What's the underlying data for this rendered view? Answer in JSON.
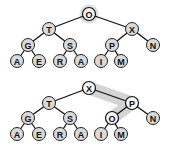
{
  "diagram": {
    "type": "heap-sink-illustration",
    "trees": [
      {
        "name": "before",
        "highlight_root": true,
        "nodes": [
          {
            "id": "n1",
            "label": "O",
            "x": 89,
            "y": 14
          },
          {
            "id": "n2",
            "label": "T",
            "x": 49,
            "y": 29
          },
          {
            "id": "n3",
            "label": "X",
            "x": 132,
            "y": 29
          },
          {
            "id": "n4",
            "label": "G",
            "x": 28,
            "y": 45
          },
          {
            "id": "n5",
            "label": "S",
            "x": 70,
            "y": 45
          },
          {
            "id": "n6",
            "label": "P",
            "x": 112,
            "y": 45
          },
          {
            "id": "n7",
            "label": "N",
            "x": 153,
            "y": 45
          },
          {
            "id": "n8",
            "label": "A",
            "x": 17,
            "y": 61
          },
          {
            "id": "n9",
            "label": "E",
            "x": 39,
            "y": 61
          },
          {
            "id": "n10",
            "label": "R",
            "x": 60,
            "y": 61
          },
          {
            "id": "n11",
            "label": "A",
            "x": 81,
            "y": 61
          },
          {
            "id": "n12",
            "label": "I",
            "x": 101,
            "y": 61
          },
          {
            "id": "n13",
            "label": "M",
            "x": 121,
            "y": 61
          }
        ],
        "edges": [
          [
            "n1",
            "n2"
          ],
          [
            "n1",
            "n3"
          ],
          [
            "n2",
            "n4"
          ],
          [
            "n2",
            "n5"
          ],
          [
            "n3",
            "n6"
          ],
          [
            "n3",
            "n7"
          ],
          [
            "n4",
            "n8"
          ],
          [
            "n4",
            "n9"
          ],
          [
            "n5",
            "n10"
          ],
          [
            "n5",
            "n11"
          ],
          [
            "n6",
            "n12"
          ],
          [
            "n6",
            "n13"
          ]
        ]
      },
      {
        "name": "after",
        "highlight_path": [
          "n1",
          "n3",
          "n6"
        ],
        "nodes": [
          {
            "id": "n1",
            "label": "X",
            "x": 89,
            "y": 88
          },
          {
            "id": "n2",
            "label": "T",
            "x": 49,
            "y": 103
          },
          {
            "id": "n3",
            "label": "P",
            "x": 132,
            "y": 103
          },
          {
            "id": "n4",
            "label": "G",
            "x": 28,
            "y": 118
          },
          {
            "id": "n5",
            "label": "S",
            "x": 70,
            "y": 118
          },
          {
            "id": "n6",
            "label": "O",
            "x": 112,
            "y": 118
          },
          {
            "id": "n7",
            "label": "N",
            "x": 153,
            "y": 118
          },
          {
            "id": "n8",
            "label": "A",
            "x": 17,
            "y": 134
          },
          {
            "id": "n9",
            "label": "E",
            "x": 39,
            "y": 134
          },
          {
            "id": "n10",
            "label": "R",
            "x": 60,
            "y": 134
          },
          {
            "id": "n11",
            "label": "A",
            "x": 81,
            "y": 134
          },
          {
            "id": "n12",
            "label": "I",
            "x": 101,
            "y": 134
          },
          {
            "id": "n13",
            "label": "M",
            "x": 121,
            "y": 134
          }
        ],
        "edges": [
          [
            "n1",
            "n2"
          ],
          [
            "n1",
            "n3"
          ],
          [
            "n2",
            "n4"
          ],
          [
            "n2",
            "n5"
          ],
          [
            "n3",
            "n6"
          ],
          [
            "n3",
            "n7"
          ],
          [
            "n4",
            "n8"
          ],
          [
            "n4",
            "n9"
          ],
          [
            "n5",
            "n10"
          ],
          [
            "n5",
            "n11"
          ],
          [
            "n6",
            "n12"
          ],
          [
            "n6",
            "n13"
          ]
        ]
      }
    ]
  }
}
